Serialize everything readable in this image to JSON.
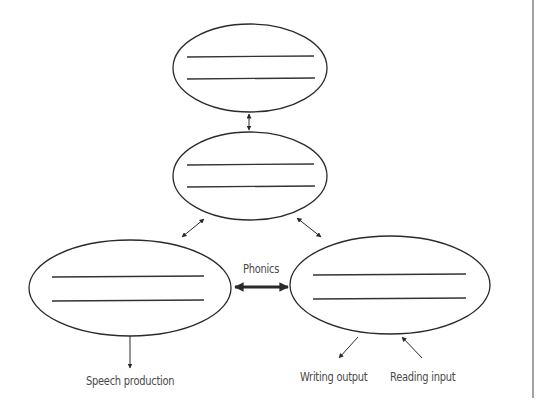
{
  "diagram": {
    "nodes": [
      {
        "id": "top",
        "label": "",
        "lines": 2,
        "blank": true
      },
      {
        "id": "middle",
        "label": "",
        "lines": 2,
        "blank": true
      },
      {
        "id": "left",
        "label": "",
        "lines": 2,
        "blank": true
      },
      {
        "id": "right",
        "label": "",
        "lines": 2,
        "blank": true
      }
    ],
    "edges": [
      {
        "from": "top",
        "to": "middle",
        "type": "bidirectional",
        "label": ""
      },
      {
        "from": "middle",
        "to": "left",
        "type": "bidirectional",
        "label": ""
      },
      {
        "from": "middle",
        "to": "right",
        "type": "bidirectional",
        "label": ""
      },
      {
        "from": "left",
        "to": "right",
        "type": "bidirectional-bold",
        "label": "Phonics"
      }
    ],
    "outputs": [
      {
        "from": "left",
        "direction": "out",
        "label": "Speech production"
      },
      {
        "from": "right",
        "direction": "out",
        "label": "Writing output"
      },
      {
        "from": "right",
        "direction": "in",
        "label": "Reading input"
      }
    ],
    "labels": {
      "phonics": "Phonics",
      "speech": "Speech production",
      "writing": "Writing output",
      "reading": "Reading input"
    },
    "colors": {
      "stroke": "#2a2a2a",
      "text": "#4a4a4a",
      "border": "#555555"
    }
  }
}
